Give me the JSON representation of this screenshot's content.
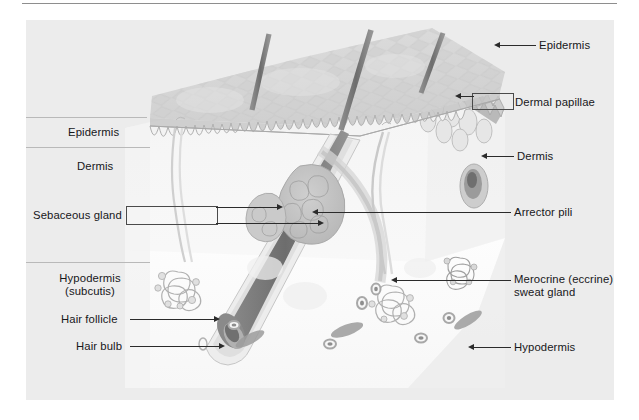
{
  "figure": {
    "background_color": "#ececec",
    "page_color": "#ffffff",
    "line_color": "#2b2b2b",
    "text_color": "#17171a"
  },
  "labels": {
    "left": [
      {
        "id": "epidermis-left",
        "text": "Epidermis"
      },
      {
        "id": "dermis-left",
        "text": "Dermis"
      },
      {
        "id": "sebaceous-gland",
        "text": "Sebaceous gland"
      },
      {
        "id": "hypodermis-left-line1",
        "text": "Hypodermis"
      },
      {
        "id": "hypodermis-left-line2",
        "text": "(subcutis)"
      },
      {
        "id": "hair-follicle",
        "text": "Hair follicle"
      },
      {
        "id": "hair-bulb",
        "text": "Hair bulb"
      }
    ],
    "right": [
      {
        "id": "epidermis-right",
        "text": "Epidermis"
      },
      {
        "id": "dermal-papillae",
        "text": "Dermal papillae"
      },
      {
        "id": "dermis-right",
        "text": "Dermis"
      },
      {
        "id": "arrector-pili",
        "text": "Arrector pili"
      },
      {
        "id": "sweat-gland-line1",
        "text": "Merocrine (eccrine)"
      },
      {
        "id": "sweat-gland-line2",
        "text": "sweat gland"
      },
      {
        "id": "hypodermis-right",
        "text": "Hypodermis"
      }
    ]
  },
  "structures": [
    "hair shaft",
    "skin surface",
    "dermal papillae",
    "sebaceous gland",
    "hair follicle",
    "hair bulb",
    "arrector pili muscle",
    "merocrine sweat gland",
    "adipose tissue",
    "blood vessel"
  ]
}
